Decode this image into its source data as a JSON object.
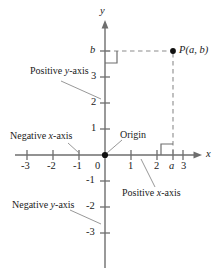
{
  "figure": {
    "type": "cartesian-coordinate-plane",
    "colors": {
      "axis": "#6e6e6e",
      "text": "#1a1a1a",
      "dashed": "#8c8c8c",
      "leader": "#8c8c8c",
      "point": "#111111",
      "background": "#ffffff"
    }
  },
  "axes": {
    "x_label": "x",
    "y_label": "y",
    "origin_x_px": 105,
    "origin_y_px": 155,
    "unit_px": 26,
    "x_ticks": [
      "-3",
      "-2",
      "-1",
      "0",
      "1",
      "2",
      "3"
    ],
    "y_ticks": [
      "3",
      "2",
      "1",
      "-1",
      "-2",
      "-3"
    ],
    "x_range": [
      -3.5,
      3.7
    ],
    "y_range": [
      -4.4,
      5.1
    ]
  },
  "point": {
    "label": "P(a, b)",
    "name": "P",
    "x_value": "a",
    "y_value": "b",
    "x_units": 2.6,
    "y_units": 4.0,
    "x_axis_tick_label": "a",
    "y_axis_tick_label": "b"
  },
  "callouts": [
    {
      "id": "positive-y-axis",
      "text": "Positive y-axis",
      "plain": "Positive ",
      "italic": "y",
      "suffix": "-axis"
    },
    {
      "id": "negative-x-axis",
      "text": "Negative x-axis",
      "plain": "Negative ",
      "italic": "x",
      "suffix": "-axis"
    },
    {
      "id": "origin",
      "text": "Origin",
      "plain": "Origin",
      "italic": "",
      "suffix": ""
    },
    {
      "id": "positive-x-axis",
      "text": "Positive x-axis",
      "plain": "Positive ",
      "italic": "x",
      "suffix": "-axis"
    },
    {
      "id": "negative-y-axis",
      "text": "Negative y-axis",
      "plain": "Negative ",
      "italic": "y",
      "suffix": "-axis"
    }
  ],
  "markers": {
    "right_angle_y": "right-angle-at-y-axis",
    "right_angle_x": "right-angle-at-x-axis"
  }
}
